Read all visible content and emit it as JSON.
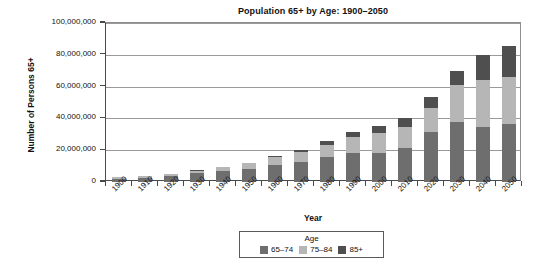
{
  "chart_data": {
    "type": "bar",
    "subtype": "stacked-bar",
    "title": "Population 65+ by Age: 1900–2050",
    "xlabel": "Year",
    "ylabel": "Number of Persons 65+",
    "categories": [
      "1900",
      "1910",
      "1920",
      "1930",
      "1940",
      "1950",
      "1960",
      "1970",
      "1980",
      "1990",
      "2000",
      "2010",
      "2020",
      "2030",
      "2040",
      "2050"
    ],
    "series": [
      {
        "name": "65–74",
        "color": "#6e6e6e",
        "values": [
          2200000,
          2800000,
          3800000,
          5400000,
          6900000,
          8400000,
          10997000,
          12447000,
          15581000,
          18107000,
          18391000,
          21705000,
          31385000,
          37445000,
          34370000,
          36275000
        ]
      },
      {
        "name": "75–84",
        "color": "#b6b6b6",
        "values": [
          770000,
          990000,
          1350000,
          1800000,
          2300000,
          3300000,
          4633000,
          6124000,
          7729000,
          10055000,
          12361000,
          12681000,
          15398000,
          23722000,
          30021000,
          30062000
        ]
      },
      {
        "name": "85+",
        "color": "#4f4f4f",
        "values": [
          120000,
          170000,
          210000,
          270000,
          370000,
          580000,
          940000,
          1409000,
          2240000,
          3021000,
          4240000,
          5751000,
          6597000,
          8745000,
          15409000,
          18903000
        ]
      }
    ],
    "totals": [
      3090000,
      3960000,
      5360000,
      7470000,
      9570000,
      12280000,
      16570000,
      19980000,
      25550000,
      31183000,
      34992000,
      40137000,
      53380000,
      69912000,
      79800000,
      85240000
    ],
    "ylim": [
      0,
      100000000
    ],
    "ytick_values": [
      0,
      20000000,
      40000000,
      60000000,
      80000000,
      100000000
    ],
    "ytick_labels": [
      "0",
      "20,000,000",
      "40,000,000",
      "60,000,000",
      "80,000,000",
      "100,000,000"
    ],
    "grid": true,
    "grid_axis": "y",
    "legend": {
      "title": "Age",
      "position": "bottom",
      "entries": [
        "65–74",
        "75–84",
        "85+"
      ]
    }
  }
}
